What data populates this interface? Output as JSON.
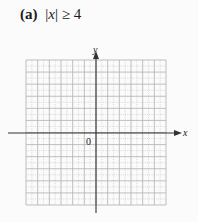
{
  "title": {
    "label": "(a)",
    "expression_prefix": "|",
    "variable": "x",
    "expression_suffix": "| ≥ 4"
  },
  "axes": {
    "x_label": "x",
    "y_label": "y",
    "origin_label": "0"
  },
  "grid": {
    "x_range": [
      -6,
      6
    ],
    "y_range": [
      -6,
      6
    ],
    "major_every": 1,
    "minor_subdivisions": 2
  },
  "colors": {
    "axis": "#333333",
    "grid_major": "#b0b0b0",
    "grid_minor": "#c8c8c8",
    "background": "#fbfbfb"
  }
}
